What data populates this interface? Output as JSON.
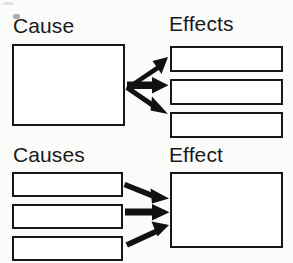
{
  "diagram": {
    "background_color": "#fbfbfa",
    "stroke_color": "#171717",
    "arrow_color": "#111111",
    "box_fill": "#ffffff",
    "sections": [
      {
        "id": "one-cause-many-effects",
        "left_label": "Cause",
        "right_label": "Effects",
        "direction": "diverging",
        "left_box_count": 1,
        "right_box_count": 3,
        "arrow_count": 3
      },
      {
        "id": "many-causes-one-effect",
        "left_label": "Causes",
        "right_label": "Effect",
        "direction": "converging",
        "left_box_count": 3,
        "right_box_count": 1,
        "arrow_count": 3
      }
    ],
    "labels": {
      "cause": "Cause",
      "effects": "Effects",
      "causes": "Causes",
      "effect": "Effect"
    },
    "boxes": {
      "cause_box": {
        "x": 12,
        "y": 44,
        "w": 113,
        "h": 82
      },
      "effect_boxes": [
        {
          "x": 170,
          "y": 46,
          "w": 113,
          "h": 26
        },
        {
          "x": 170,
          "y": 79,
          "w": 113,
          "h": 26
        },
        {
          "x": 170,
          "y": 112,
          "w": 113,
          "h": 26
        }
      ],
      "cause_boxes": [
        {
          "x": 12,
          "y": 172,
          "w": 111,
          "h": 25
        },
        {
          "x": 12,
          "y": 204,
          "w": 111,
          "h": 25
        },
        {
          "x": 12,
          "y": 236,
          "w": 111,
          "h": 25
        }
      ],
      "effect_box": {
        "x": 170,
        "y": 172,
        "w": 113,
        "h": 76
      }
    },
    "label_positions": {
      "cause": {
        "x": 13,
        "y": 15
      },
      "effects": {
        "x": 169,
        "y": 13
      },
      "causes": {
        "x": 13,
        "y": 144
      },
      "effect": {
        "x": 169,
        "y": 144
      }
    },
    "arrows": {
      "diverging_origin": {
        "x": 127,
        "y": 85
      },
      "diverging_tips": [
        {
          "x": 167,
          "y": 59
        },
        {
          "x": 167,
          "y": 85
        },
        {
          "x": 167,
          "y": 112
        }
      ],
      "converging_tips": [
        {
          "x": 168,
          "y": 197
        },
        {
          "x": 168,
          "y": 212
        },
        {
          "x": 168,
          "y": 227
        }
      ],
      "converging_starts": [
        {
          "x": 126,
          "y": 183
        },
        {
          "x": 126,
          "y": 212
        },
        {
          "x": 126,
          "y": 242
        }
      ]
    }
  }
}
